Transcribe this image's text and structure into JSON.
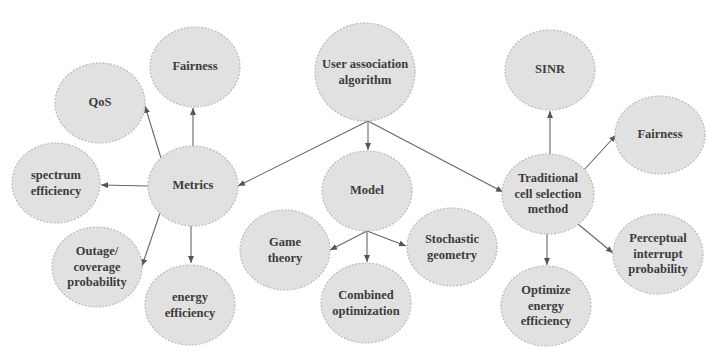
{
  "diagram": {
    "colors": {
      "node_fill": "#e1e1e1",
      "node_stroke": "#b9b9b9",
      "text": "#3c3c3c",
      "edge": "#666666",
      "background": "#ffffff"
    },
    "nodes": [
      {
        "id": "user-association-algorithm",
        "label": "User association\nalgorithm",
        "cx": 365,
        "cy": 72,
        "rx": 50,
        "ry": 49
      },
      {
        "id": "metrics",
        "label": "Metrics",
        "cx": 193,
        "cy": 186,
        "rx": 45,
        "ry": 40
      },
      {
        "id": "model",
        "label": "Model",
        "cx": 367,
        "cy": 191,
        "rx": 45,
        "ry": 40
      },
      {
        "id": "traditional-cell-selection-method",
        "label": "Traditional\ncell selection\nmethod",
        "cx": 548,
        "cy": 194,
        "rx": 46,
        "ry": 40
      },
      {
        "id": "fairness-metrics",
        "label": "Fairness",
        "cx": 195,
        "cy": 67,
        "rx": 45,
        "ry": 40
      },
      {
        "id": "qos",
        "label": "QoS",
        "cx": 100,
        "cy": 103,
        "rx": 45,
        "ry": 40
      },
      {
        "id": "spectrum-efficiency",
        "label": "spectrum\nefficiency",
        "cx": 56,
        "cy": 183,
        "rx": 44,
        "ry": 40
      },
      {
        "id": "outage-coverage-probability",
        "label": "Outage/\ncoverage\nprobability",
        "cx": 97,
        "cy": 267,
        "rx": 45,
        "ry": 40
      },
      {
        "id": "energy-efficiency",
        "label": "energy\nefficiency",
        "cx": 190,
        "cy": 305,
        "rx": 45,
        "ry": 40
      },
      {
        "id": "game-theory",
        "label": "Game\ntheory",
        "cx": 285,
        "cy": 250,
        "rx": 45,
        "ry": 40
      },
      {
        "id": "combined-optimization",
        "label": "Combined\noptimization",
        "cx": 366,
        "cy": 303,
        "rx": 45,
        "ry": 40
      },
      {
        "id": "stochastic-geometry",
        "label": "Stochastic\ngeometry",
        "cx": 452,
        "cy": 247,
        "rx": 45,
        "ry": 39
      },
      {
        "id": "sinr",
        "label": "SINR",
        "cx": 550,
        "cy": 70,
        "rx": 45,
        "ry": 40
      },
      {
        "id": "fairness-traditional",
        "label": "Fairness",
        "cx": 660,
        "cy": 135,
        "rx": 45,
        "ry": 39
      },
      {
        "id": "perceptual-interrupt-probability",
        "label": "Perceptual\ninterrupt\nprobability",
        "cx": 658,
        "cy": 254,
        "rx": 45,
        "ry": 40
      },
      {
        "id": "optimize-energy-efficiency",
        "label": "Optimize\nenergy\nefficiency",
        "cx": 546,
        "cy": 306,
        "rx": 45,
        "ry": 40
      }
    ],
    "edges": [
      {
        "from": "user-association-algorithm",
        "to": "metrics",
        "x1": 368,
        "y1": 121,
        "x2": 238,
        "y2": 186
      },
      {
        "from": "user-association-algorithm",
        "to": "model",
        "x1": 368,
        "y1": 121,
        "x2": 368,
        "y2": 150
      },
      {
        "from": "user-association-algorithm",
        "to": "traditional-cell-selection-method",
        "x1": 368,
        "y1": 121,
        "x2": 503,
        "y2": 192
      },
      {
        "from": "metrics",
        "to": "qos",
        "x1": 161,
        "y1": 158,
        "x2": 145,
        "y2": 106
      },
      {
        "from": "metrics",
        "to": "fairness-metrics",
        "x1": 193,
        "y1": 147,
        "x2": 193,
        "y2": 108
      },
      {
        "from": "metrics",
        "to": "spectrum-efficiency",
        "x1": 148,
        "y1": 186,
        "x2": 101,
        "y2": 185
      },
      {
        "from": "metrics",
        "to": "outage-coverage-probability",
        "x1": 160,
        "y1": 213,
        "x2": 142,
        "y2": 266
      },
      {
        "from": "metrics",
        "to": "energy-efficiency",
        "x1": 191,
        "y1": 226,
        "x2": 191,
        "y2": 263
      },
      {
        "from": "model",
        "to": "game-theory",
        "x1": 367,
        "y1": 231,
        "x2": 330,
        "y2": 250
      },
      {
        "from": "model",
        "to": "combined-optimization",
        "x1": 367,
        "y1": 231,
        "x2": 367,
        "y2": 262
      },
      {
        "from": "model",
        "to": "stochastic-geometry",
        "x1": 367,
        "y1": 231,
        "x2": 406,
        "y2": 246
      },
      {
        "from": "traditional-cell-selection-method",
        "to": "sinr",
        "x1": 550,
        "y1": 154,
        "x2": 550,
        "y2": 111
      },
      {
        "from": "traditional-cell-selection-method",
        "to": "fairness-traditional",
        "x1": 584,
        "y1": 170,
        "x2": 616,
        "y2": 135
      },
      {
        "from": "traditional-cell-selection-method",
        "to": "perceptual-interrupt-probability",
        "x1": 578,
        "y1": 224,
        "x2": 613,
        "y2": 253
      },
      {
        "from": "traditional-cell-selection-method",
        "to": "optimize-energy-efficiency",
        "x1": 547,
        "y1": 234,
        "x2": 547,
        "y2": 265
      }
    ]
  }
}
